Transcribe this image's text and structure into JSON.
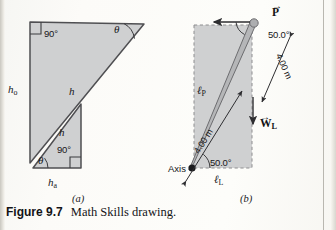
{
  "figure": {
    "caption_number": "Figure 9.7",
    "caption_text": "Math Skills drawing.",
    "panel_a_label": "(a)",
    "panel_b_label": "(b)"
  },
  "panel_a": {
    "name": "math-skills-similar-triangles",
    "labels": {
      "right_angle_large": "90°",
      "right_angle_small": "90°",
      "theta_large": "θ",
      "theta_small": "θ",
      "hypotenuse_large": "h",
      "hypotenuse_small": "h",
      "side_opposite": "h",
      "side_opposite_sub": "o",
      "side_adjacent": "h",
      "side_adjacent_sub": "a"
    }
  },
  "panel_b": {
    "name": "ladder-lever-arm-diagram",
    "labels": {
      "force_P": "P",
      "weight_W": "W",
      "weight_W_sub": "L",
      "lever_arm_P": "ℓ",
      "lever_arm_P_sub": "P",
      "lever_arm_L": "ℓ",
      "lever_arm_L_sub": "L",
      "axis": "Axis",
      "angle_top": "50.0°",
      "angle_bottom": "50.0°",
      "length_upper": "4.00 m",
      "length_lower": "4.00 m"
    }
  },
  "colors": {
    "fill_gray": "#cfd0d1",
    "bar_gray": "#a9aaac",
    "stroke_dark": "#4a4a4d",
    "dashed_gray": "#9a9a9c",
    "page_bg": "#fdfdfb",
    "text": "#17171a"
  }
}
